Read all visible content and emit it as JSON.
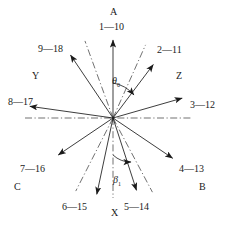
{
  "figure": {
    "type": "radial-vector-diagram",
    "center": {
      "x": 113,
      "y": 118
    },
    "background_color": "#ffffff",
    "line_color": "#1a1a1a",
    "dashdot_color": "#333333"
  },
  "axis_labels": {
    "top": "A",
    "bottom": "X",
    "left": "Y",
    "right": "Z",
    "lower_left": "C",
    "lower_right": "B"
  },
  "angles": [
    {
      "name": "theta",
      "symbol": "θ",
      "subscript": "0",
      "x": 112,
      "y": 76
    },
    {
      "name": "beta",
      "symbol": "β",
      "subscript": "1",
      "x": 113,
      "y": 175
    }
  ],
  "vectors": [
    {
      "id": "v1",
      "label": "1—10",
      "angle_deg": 90,
      "length": 78,
      "label_x": 99,
      "label_y": 22,
      "arrow": true
    },
    {
      "id": "v2",
      "label": "2—11",
      "angle_deg": 53,
      "length": 67,
      "label_x": 157,
      "label_y": 45,
      "arrow": true
    },
    {
      "id": "v3",
      "label": "3—12",
      "angle_deg": 16,
      "length": 72,
      "label_x": 190,
      "label_y": 100,
      "arrow": true
    },
    {
      "id": "v4",
      "label": "4—13",
      "angle_deg": -34,
      "length": 72,
      "label_x": 179,
      "label_y": 164,
      "arrow": true
    },
    {
      "id": "v5",
      "label": "5—14",
      "angle_deg": -72,
      "length": 76,
      "label_x": 124,
      "label_y": 202,
      "arrow": true
    },
    {
      "id": "v6",
      "label": "6—15",
      "angle_deg": -102,
      "length": 78,
      "label_x": 62,
      "label_y": 202,
      "arrow": true
    },
    {
      "id": "v7",
      "label": "7—16",
      "angle_deg": -146,
      "length": 66,
      "label_x": 20,
      "label_y": 164,
      "arrow": true
    },
    {
      "id": "v8",
      "label": "8—17",
      "angle_deg": 172,
      "length": 84,
      "label_x": 8,
      "label_y": 97,
      "arrow": true
    },
    {
      "id": "v9",
      "label": "9—18",
      "angle_deg": 124,
      "length": 76,
      "label_x": 38,
      "label_y": 44,
      "arrow": true
    }
  ],
  "reference_lines": [
    {
      "id": "r-horizontal",
      "angle_deg": 0,
      "length_pos": 78,
      "length_neg": 88
    },
    {
      "id": "r-vertical",
      "angle_deg": -90,
      "length_pos": 80,
      "length_neg": 0
    },
    {
      "id": "r-upper-right",
      "angle_deg": 66,
      "length_pos": 80,
      "length_neg": 0
    },
    {
      "id": "r-upper-left",
      "angle_deg": 110,
      "length_pos": 82,
      "length_neg": 0
    },
    {
      "id": "r-lower-right",
      "angle_deg": -62,
      "length_pos": 84,
      "length_neg": 0
    },
    {
      "id": "r-lower-left",
      "angle_deg": -117,
      "length_pos": 82,
      "length_neg": 0
    }
  ],
  "chart_data": {
    "type": "scatter",
    "title": "",
    "xlabel": "",
    "ylabel": "",
    "note": "Radial vector / crystallographic slip-direction diagram: nine labelled arrows (1-10 ... 9-18) emanate from a common origin, with dash-dot reference axes and two marked angles theta-0 and beta-1.",
    "categories": [
      "1—10",
      "2—11",
      "3—12",
      "4—13",
      "5—14",
      "6—15",
      "7—16",
      "8—17",
      "9—18"
    ],
    "values": [
      90,
      53,
      16,
      -34,
      -72,
      -102,
      -146,
      172,
      124
    ]
  }
}
